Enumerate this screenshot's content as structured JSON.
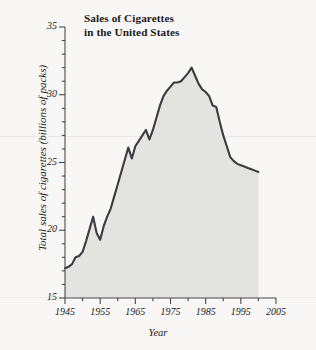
{
  "chart_data": {
    "type": "area",
    "title_line1": "Sales of Cigarettes",
    "title_line2": "in the United States",
    "xlabel": "Year",
    "ylabel": "Total sales of cigarettes (billions of packs)",
    "xlim": [
      1945,
      2005
    ],
    "ylim": [
      15,
      35
    ],
    "xticks": [
      1945,
      1955,
      1965,
      1975,
      1985,
      1995,
      2005
    ],
    "xtick_labels": [
      "1945",
      "1955",
      "1965",
      "1975",
      "1985",
      "1995",
      "2005"
    ],
    "xminor_interval": 5,
    "yticks": [
      15,
      20,
      25,
      30,
      35
    ],
    "ytick_labels": [
      "15",
      "20",
      "25",
      "30",
      "35"
    ],
    "yminor_interval": 1,
    "grid": false,
    "legend": null,
    "line_color": "#3b3b40",
    "fill_color": "#e3e3e2",
    "axis_color": "#4a4a50",
    "background_color": "#f8f7f5",
    "data_x_start": 1945,
    "data_x_end": 2000,
    "x": [
      1945,
      1946,
      1947,
      1948,
      1949,
      1950,
      1951,
      1952,
      1953,
      1954,
      1955,
      1956,
      1957,
      1958,
      1959,
      1960,
      1961,
      1962,
      1963,
      1964,
      1965,
      1966,
      1967,
      1968,
      1969,
      1970,
      1971,
      1972,
      1973,
      1974,
      1975,
      1976,
      1977,
      1978,
      1979,
      1980,
      1981,
      1982,
      1983,
      1984,
      1985,
      1986,
      1987,
      1988,
      1989,
      1990,
      1991,
      1992,
      1993,
      1994,
      1995,
      1996,
      1997,
      1998,
      1999,
      2000
    ],
    "values": [
      17.2,
      17.3,
      17.5,
      18.0,
      18.1,
      18.4,
      19.2,
      20.1,
      21.0,
      19.8,
      19.3,
      20.3,
      21.0,
      21.6,
      22.5,
      23.4,
      24.3,
      25.2,
      26.1,
      25.3,
      26.2,
      26.6,
      27.0,
      27.4,
      26.7,
      27.4,
      28.3,
      29.2,
      29.9,
      30.3,
      30.6,
      30.9,
      30.9,
      31.0,
      31.3,
      31.6,
      32.0,
      31.4,
      30.8,
      30.4,
      30.2,
      29.9,
      29.2,
      29.1,
      28.0,
      27.0,
      26.2,
      25.4,
      25.1,
      24.9,
      24.8,
      24.7,
      24.6,
      24.5,
      24.4,
      24.3
    ]
  }
}
